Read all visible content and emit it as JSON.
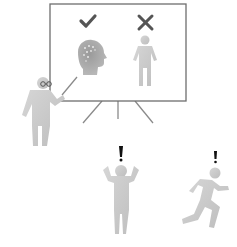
{
  "illustration": {
    "board": {
      "approved_symbol": "check-mark",
      "rejected_symbol": "x-mark",
      "approved_item": "head-with-brain",
      "rejected_item": "standing-person"
    },
    "presenter": "person-with-glasses-and-pointer",
    "reactions": [
      {
        "figure": "person-holding-head",
        "symbol": "!"
      },
      {
        "figure": "running-person",
        "symbol": "!"
      }
    ],
    "colors": {
      "figure": "#c8c8c8",
      "figure_dark": "#a9a9a9",
      "board_frame": "#6e6e6e",
      "mark": "#555555",
      "exclaim": "#111111"
    }
  }
}
